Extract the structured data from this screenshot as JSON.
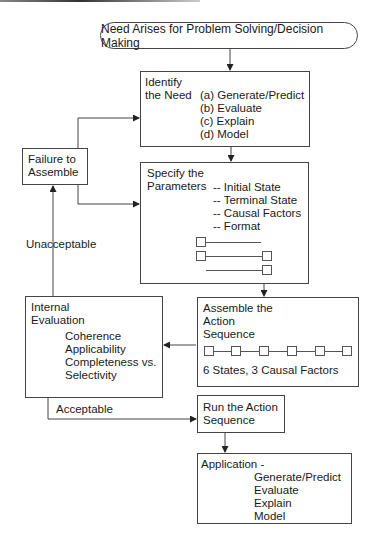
{
  "title": "Need Arises for Problem Solving/Decision Making",
  "identify": {
    "heading": [
      "Identify",
      "the Need"
    ],
    "options": [
      "(a) Generate/Predict",
      "(b) Evaluate",
      "(c) Explain",
      "(d) Model"
    ]
  },
  "failure": {
    "label": [
      "Failure to",
      "Assemble"
    ]
  },
  "specify": {
    "heading": [
      "Specify the",
      "Parameters"
    ],
    "items": [
      "-- Initial State",
      "-- Terminal State",
      "-- Causal Factors",
      "-- Format"
    ]
  },
  "assemble": {
    "heading": [
      "Assemble the",
      "Action",
      "Sequence"
    ],
    "caption": "6 States, 3 Causal Factors",
    "state_count": 6
  },
  "evaluation": {
    "heading": [
      "Internal",
      "Evaluation"
    ],
    "criteria": [
      "Coherence",
      "Applicability",
      "Completeness vs.",
      "Selectivity"
    ]
  },
  "edges": {
    "unacceptable": "Unacceptable",
    "acceptable": "Acceptable"
  },
  "run": {
    "label": [
      "Run the Action",
      "Sequence"
    ]
  },
  "application": {
    "heading": "Application -",
    "items": [
      "Generate/Predict",
      "Evaluate",
      "Explain",
      "Model"
    ]
  }
}
